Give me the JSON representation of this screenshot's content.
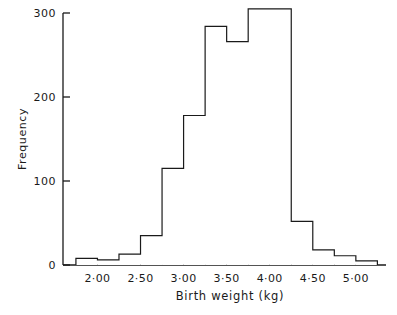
{
  "chart_data": {
    "type": "bar",
    "title": "",
    "subtitle": "",
    "xlabel": "Birth weight (kg)",
    "ylabel": "Frequency",
    "grid": false,
    "legend": null,
    "legend_position": "none",
    "bin_width": 0.25,
    "x_range": [
      1.75,
      5.25
    ],
    "xlim": [
      1.6,
      5.35
    ],
    "ylim": [
      0,
      310
    ],
    "y_tick_values": [
      0,
      100,
      200,
      300
    ],
    "y_tick_labels": [
      "0",
      "100",
      "200",
      "300"
    ],
    "x_tick_values": [
      2.0,
      2.5,
      3.0,
      3.5,
      4.0,
      4.5,
      5.0
    ],
    "x_tick_labels": [
      "2·00",
      "2·50",
      "3·00",
      "3·50",
      "4·00",
      "4·50",
      "5·00"
    ],
    "bin_edges": [
      1.75,
      2.0,
      2.25,
      2.5,
      2.75,
      3.0,
      3.25,
      3.5,
      3.75,
      4.0,
      4.25,
      4.5,
      4.75,
      5.0,
      5.25
    ],
    "categories": [
      "1.75-2.00",
      "2.00-2.25",
      "2.25-2.50",
      "2.50-2.75",
      "2.75-3.00",
      "3.00-3.25",
      "3.25-3.50",
      "3.50-3.75",
      "3.75-4.00",
      "4.00-4.25",
      "4.25-4.50",
      "4.50-4.75",
      "4.75-5.00",
      "5.00-5.25"
    ],
    "values": [
      8,
      6,
      13,
      35,
      115,
      178,
      284,
      266,
      305,
      305,
      52,
      18,
      11,
      5
    ],
    "bar_fill_color": "#ffffff",
    "bar_edge_color": "#1a1a1a",
    "axis_color": "#1a1a1a",
    "background_color": "#ffffff"
  },
  "axes": {
    "y_title": "Frequency",
    "x_title": "Birth weight (kg)"
  }
}
